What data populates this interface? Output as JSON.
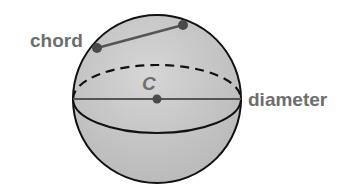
{
  "diagram": {
    "labels": {
      "chord": "chord",
      "center": "C",
      "diameter": "diameter"
    },
    "colors": {
      "sphere_fill": "#c4c4c4",
      "outline": "#111111",
      "segment": "#555555",
      "point": "#4a4a4a",
      "label": "#6e6e6e"
    }
  }
}
